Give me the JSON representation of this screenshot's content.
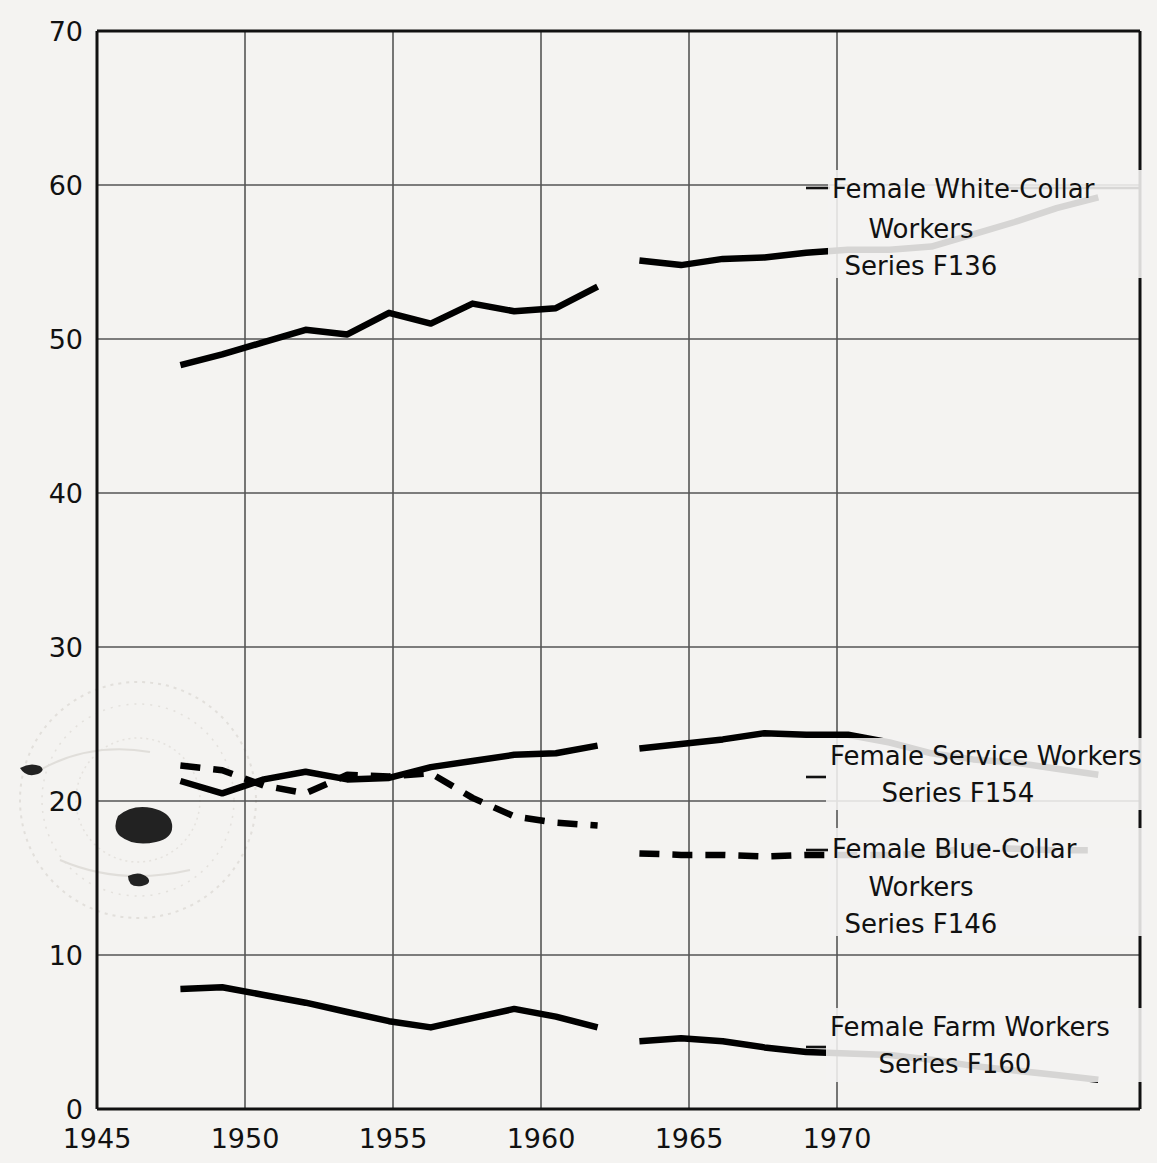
{
  "chart_data": {
    "type": "line",
    "title": "",
    "xlabel": "",
    "ylabel": "",
    "xlim": [
      1945,
      1970
    ],
    "ylim": [
      0,
      70
    ],
    "xticks": [
      1945,
      1950,
      1955,
      1960,
      1965,
      1970
    ],
    "yticks": [
      0,
      10,
      20,
      30,
      40,
      50,
      60,
      70
    ],
    "grid": true,
    "legend_position": "right-inline-annotations",
    "series": [
      {
        "name": "Female White-Collar Workers",
        "series_code": "Series F136",
        "style": "solid",
        "color": "#000000",
        "segments": [
          {
            "x": [
              1947,
              1948,
              1949,
              1950,
              1951,
              1952,
              1953,
              1954,
              1955,
              1956,
              1957
            ],
            "y": [
              48.3,
              49.0,
              49.8,
              50.6,
              50.3,
              51.7,
              51.0,
              52.3,
              51.8,
              52.0,
              53.4
            ]
          },
          {
            "x": [
              1958,
              1959,
              1960,
              1961,
              1962,
              1963,
              1964,
              1965,
              1966,
              1967,
              1968,
              1969
            ],
            "y": [
              55.1,
              54.8,
              55.2,
              55.3,
              55.6,
              55.8,
              55.8,
              56.0,
              56.8,
              57.6,
              58.5,
              59.2
            ]
          }
        ]
      },
      {
        "name": "Female Service Workers",
        "series_code": "Series F154",
        "style": "solid",
        "color": "#000000",
        "segments": [
          {
            "x": [
              1947,
              1948,
              1949,
              1950,
              1951,
              1952,
              1953,
              1954,
              1955,
              1956,
              1957
            ],
            "y": [
              21.3,
              20.5,
              21.4,
              21.9,
              21.4,
              21.5,
              22.2,
              22.6,
              23.0,
              23.1,
              23.6
            ]
          },
          {
            "x": [
              1958,
              1959,
              1960,
              1961,
              1962,
              1963,
              1964,
              1965,
              1966,
              1967,
              1968,
              1969
            ],
            "y": [
              23.4,
              23.7,
              24.0,
              24.4,
              24.3,
              24.3,
              23.8,
              23.1,
              22.7,
              22.5,
              22.1,
              21.7
            ]
          }
        ]
      },
      {
        "name": "Female Blue-Collar Workers",
        "series_code": "Series F146",
        "style": "dashed",
        "color": "#000000",
        "segments": [
          {
            "x": [
              1947,
              1948,
              1949,
              1950,
              1951,
              1952,
              1953,
              1954,
              1955,
              1956,
              1957
            ],
            "y": [
              22.3,
              22.0,
              21.0,
              20.5,
              21.7,
              21.6,
              21.8,
              20.2,
              19.0,
              18.6,
              18.4
            ]
          },
          {
            "x": [
              1958,
              1959,
              1960,
              1961,
              1962,
              1963,
              1964,
              1965,
              1966,
              1967,
              1968,
              1969
            ],
            "y": [
              16.6,
              16.5,
              16.5,
              16.4,
              16.5,
              16.5,
              16.5,
              16.6,
              17.0,
              16.9,
              16.8,
              16.8
            ]
          }
        ]
      },
      {
        "name": "Female Farm Workers",
        "series_code": "Series F160",
        "style": "solid",
        "color": "#000000",
        "segments": [
          {
            "x": [
              1947,
              1948,
              1949,
              1950,
              1951,
              1952,
              1953,
              1954,
              1955,
              1956,
              1957
            ],
            "y": [
              7.8,
              7.9,
              7.4,
              6.9,
              6.3,
              5.7,
              5.3,
              5.9,
              6.5,
              6.0,
              5.3
            ]
          },
          {
            "x": [
              1958,
              1959,
              1960,
              1961,
              1962,
              1963,
              1964,
              1965,
              1966,
              1967,
              1968,
              1969
            ],
            "y": [
              4.4,
              4.6,
              4.4,
              4.0,
              3.7,
              3.6,
              3.5,
              3.2,
              2.8,
              2.5,
              2.2,
              1.9
            ]
          }
        ]
      }
    ]
  },
  "axis": {
    "y_ticks": [
      "70",
      "60",
      "50",
      "40",
      "30",
      "20",
      "10",
      "0"
    ],
    "x_ticks": [
      "1945",
      "1950",
      "1955",
      "1960",
      "1965",
      "1970"
    ]
  },
  "annotations": [
    {
      "id": "white-collar",
      "line1": "Female White-Collar",
      "line2": "Workers",
      "line3": "Series F136"
    },
    {
      "id": "service",
      "line1": "Female Service Workers",
      "line2": "Series F154",
      "line3": ""
    },
    {
      "id": "blue-collar",
      "line1": "Female Blue-Collar",
      "line2": "Workers",
      "line3": "Series F146"
    },
    {
      "id": "farm",
      "line1": "Female Farm Workers",
      "line2": "Series F160",
      "line3": ""
    }
  ],
  "colors": {
    "page_background": "#f4f3f1",
    "ink": "#111111",
    "grid": "#555555",
    "line": "#000000"
  }
}
